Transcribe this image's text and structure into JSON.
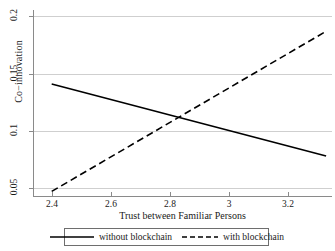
{
  "chart_data": {
    "type": "line",
    "title": "",
    "xlabel": "Trust between Familiar Persons",
    "ylabel": "Co−innovation",
    "xlim": [
      2.34,
      3.35
    ],
    "ylim": [
      0.043,
      0.203
    ],
    "xticks": [
      "2.4",
      "2.6",
      "2.8",
      "3",
      "3.2"
    ],
    "xtick_values": [
      2.4,
      2.6,
      2.8,
      3,
      3.2
    ],
    "yticks": [
      "0.05",
      "0.1",
      "0.15",
      "0.2"
    ],
    "ytick_values": [
      0.05,
      0.1,
      0.15,
      0.2
    ],
    "grid": "horizontal",
    "legend_position": "below-plot",
    "series": [
      {
        "name": "without blockchain",
        "style": "solid",
        "color": "#000000",
        "x": [
          2.4,
          3.33
        ],
        "values": [
          0.141,
          0.078
        ]
      },
      {
        "name": "with blockchain",
        "style": "dashed",
        "color": "#000000",
        "x": [
          2.4,
          3.33
        ],
        "values": [
          0.047,
          0.187
        ]
      }
    ],
    "annotations": [
      {
        "text": "lines intersect",
        "x": 2.83,
        "y": 0.114
      }
    ]
  },
  "legend": {
    "items": [
      {
        "label": "without blockchain",
        "style": "solid"
      },
      {
        "label": "with blockchain",
        "style": "dashed"
      }
    ]
  }
}
